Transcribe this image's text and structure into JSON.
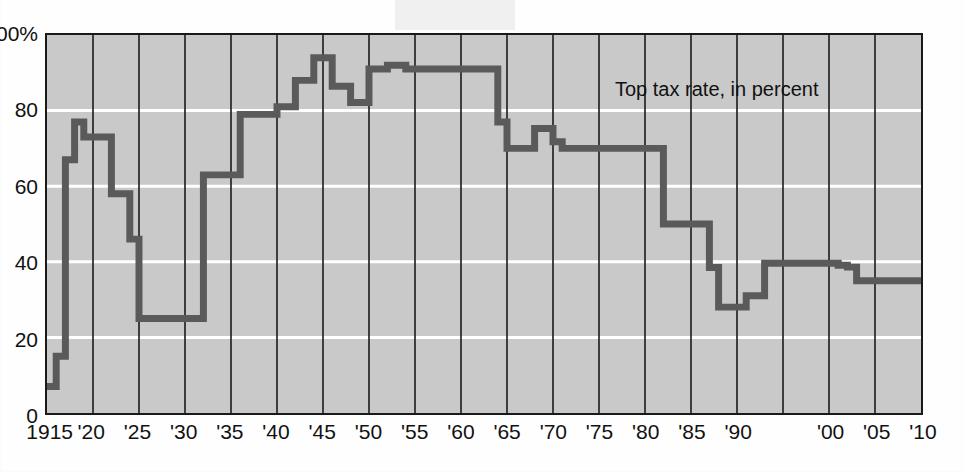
{
  "figure": {
    "series_label": "Top tax rate, in percent",
    "plot_background_color": "#c9c9c9",
    "line_color": "#5a5a5a",
    "gridline_color_horizontal": "#ffffff",
    "gridline_color_vertical": "#1a1a1a",
    "frame_color": "#1a1a1a"
  },
  "chart_data": {
    "type": "line",
    "title": "",
    "subtitle": "",
    "annotations": [
      "Top tax rate, in percent"
    ],
    "xlabel": "",
    "ylabel": "",
    "xlim": [
      1915,
      2010
    ],
    "ylim": [
      0,
      100
    ],
    "grid": "horizontal white gridlines at 20/40/60/80; vertical black gridlines every 5 years",
    "legend_position": "inside-top-right",
    "step": "post",
    "x_tick_labels": [
      "1915",
      "'20",
      "'25",
      "'30",
      "'35",
      "'40",
      "'45",
      "'50",
      "'55",
      "'60",
      "'65",
      "'70",
      "'75",
      "'80",
      "'85",
      "'90",
      "'00",
      "'05",
      "'10"
    ],
    "x_tick_values": [
      1915,
      1920,
      1925,
      1930,
      1935,
      1940,
      1945,
      1950,
      1955,
      1960,
      1965,
      1970,
      1975,
      1980,
      1985,
      1990,
      1995,
      2000,
      2005,
      2010
    ],
    "y_tick_labels": [
      "0",
      "20",
      "40",
      "60",
      "80",
      "100%"
    ],
    "y_tick_values": [
      0,
      20,
      40,
      60,
      80,
      100
    ],
    "series": [
      {
        "name": "Top tax rate, in percent",
        "x": [
          1915,
          1916,
          1917,
          1918,
          1919,
          1921,
          1922,
          1924,
          1925,
          1930,
          1932,
          1936,
          1940,
          1941,
          1942,
          1944,
          1946,
          1948,
          1950,
          1951,
          1952,
          1954,
          1964,
          1965,
          1968,
          1970,
          1971,
          1981,
          1982,
          1987,
          1988,
          1991,
          1993,
          2001,
          2002,
          2003,
          2010
        ],
        "values": [
          7,
          15,
          67,
          77,
          73,
          73,
          58,
          46,
          25,
          25,
          63,
          79,
          81,
          81,
          88,
          94,
          86.45,
          82.13,
          91,
          91,
          92,
          91,
          77,
          70,
          75.25,
          71.75,
          70,
          70,
          50,
          38.5,
          28,
          31,
          39.6,
          39.1,
          38.6,
          35,
          35
        ]
      }
    ]
  }
}
